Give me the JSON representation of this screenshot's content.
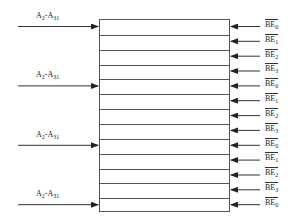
{
  "diagram": {
    "type": "memory-bank-byte-enable",
    "row_count": 13,
    "address_inputs": [
      {
        "label": "A",
        "sub_from": "2",
        "mid": "-A",
        "sub_to": "31",
        "row": 0
      },
      {
        "label": "A",
        "sub_from": "2",
        "mid": "-A",
        "sub_to": "31",
        "row": 4
      },
      {
        "label": "A",
        "sub_from": "2",
        "mid": "-A",
        "sub_to": "31",
        "row": 8
      },
      {
        "label": "A",
        "sub_from": "2",
        "mid": "-A",
        "sub_to": "31",
        "row": 12
      }
    ],
    "byte_enables": [
      {
        "name": "BE",
        "sub": "0"
      },
      {
        "name": "BE",
        "sub": "1"
      },
      {
        "name": "BE",
        "sub": "2"
      },
      {
        "name": "BE",
        "sub": "3"
      },
      {
        "name": "BE",
        "sub": "0"
      },
      {
        "name": "BE",
        "sub": "1"
      },
      {
        "name": "BE",
        "sub": "2"
      },
      {
        "name": "BE",
        "sub": "3"
      },
      {
        "name": "BE",
        "sub": "0"
      },
      {
        "name": "BE",
        "sub": "1"
      },
      {
        "name": "BE",
        "sub": "2"
      },
      {
        "name": "BE",
        "sub": "3"
      },
      {
        "name": "BE",
        "sub": "0"
      }
    ],
    "line_color": "#333333"
  }
}
